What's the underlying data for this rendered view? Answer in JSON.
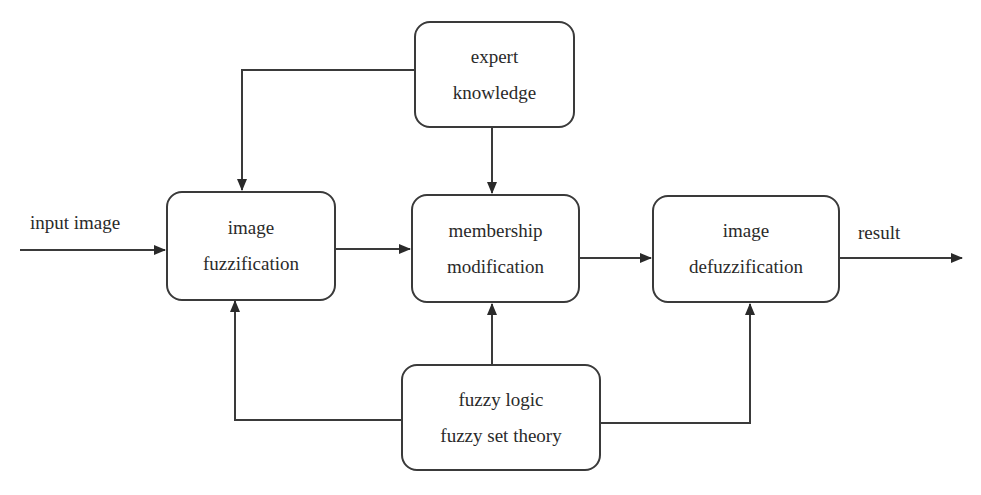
{
  "diagram": {
    "nodes": [
      {
        "id": "expert",
        "lines": [
          "expert",
          "knowledge"
        ]
      },
      {
        "id": "fuzzification",
        "lines": [
          "image",
          "fuzzification"
        ]
      },
      {
        "id": "membership",
        "lines": [
          "membership",
          "modification"
        ]
      },
      {
        "id": "defuzzification",
        "lines": [
          "image",
          "defuzzification"
        ]
      },
      {
        "id": "fuzzy_logic",
        "lines": [
          "fuzzy logic",
          "fuzzy set theory"
        ]
      }
    ],
    "labels": {
      "input": "input image",
      "output": "result"
    },
    "edges": [
      {
        "from": "input",
        "to": "fuzzification"
      },
      {
        "from": "fuzzification",
        "to": "membership"
      },
      {
        "from": "membership",
        "to": "defuzzification"
      },
      {
        "from": "defuzzification",
        "to": "result"
      },
      {
        "from": "expert",
        "to": "fuzzification"
      },
      {
        "from": "expert",
        "to": "membership"
      },
      {
        "from": "fuzzy_logic",
        "to": "fuzzification"
      },
      {
        "from": "fuzzy_logic",
        "to": "membership"
      },
      {
        "from": "fuzzy_logic",
        "to": "defuzzification"
      }
    ],
    "colors": {
      "line": "#3a3a3a",
      "text": "#2a2a2a",
      "background": "#ffffff"
    }
  }
}
